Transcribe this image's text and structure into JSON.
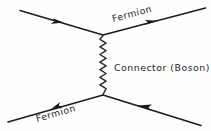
{
  "diagram": {
    "type": "feynman-diagram",
    "background_color": "#fefefe",
    "ink_color": "#1b1b1b",
    "labels": {
      "top_fermion": "Fermion",
      "bottom_fermion": "Fermion",
      "connector": "Connector  (Boson)"
    },
    "elements": {
      "top_left_leg": "incoming-fermion-line",
      "top_right_leg": "outgoing-fermion-line",
      "bottom_left_leg": "outgoing-fermion-line",
      "bottom_right_leg": "incoming-fermion-line",
      "exchange": "wavy-boson-propagator",
      "top_vertex": "interaction-vertex",
      "bottom_vertex": "interaction-vertex"
    },
    "geometry": {
      "top_vertex": [
        103,
        35
      ],
      "bottom_vertex": [
        103,
        95
      ],
      "top_left_end": [
        20,
        10
      ],
      "top_right_end": [
        205,
        8
      ],
      "bottom_left_end": [
        8,
        122
      ],
      "bottom_right_end": [
        201,
        125
      ],
      "wave_amplitude": 3.2,
      "wave_period": 7.6
    }
  }
}
